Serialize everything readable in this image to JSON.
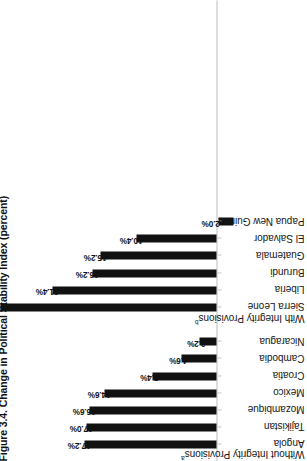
{
  "figure": {
    "title": "Figure 3.4. Change in Political Stability Index (percent)",
    "groups": [
      {
        "id": "without",
        "label": "Without Integrity Provisions",
        "note": "a"
      },
      {
        "id": "with",
        "label": "With Integrity Provisions",
        "note": "b"
      }
    ]
  },
  "chart_data": {
    "type": "bar",
    "title": "Figure 3.4. Change in Political Stability Index (percent)",
    "xlabel": "",
    "ylabel": "percent",
    "orientation": "vertical-bars-rotated-90",
    "ylim": [
      -4,
      30
    ],
    "grid": false,
    "legend": null,
    "categories": [
      "Angola",
      "Tajikistan",
      "Mozambique",
      "Mexico",
      "Croatia",
      "Cambodia",
      "Nicaragua",
      "Sierra Leone",
      "Liberia",
      "Burundi",
      "Guatemala",
      "El Salvador",
      "Papua New Guinea"
    ],
    "values": [
      17.2,
      17.0,
      16.6,
      14.6,
      8.4,
      4.6,
      2.2,
      29.0,
      21.4,
      16.2,
      15.2,
      10.4,
      -2.0
    ],
    "value_labels": [
      "17.2%",
      "17.0%",
      "16.6%",
      "14.6%",
      "8.4%",
      "4.6%",
      "2.2%",
      "",
      "21.4%",
      "16.2%",
      "15.2%",
      "10.4%",
      "-2.0%"
    ],
    "group_of": [
      "Without Integrity Provisions",
      "Without Integrity Provisions",
      "Without Integrity Provisions",
      "Without Integrity Provisions",
      "Without Integrity Provisions",
      "Without Integrity Provisions",
      "Without Integrity Provisions",
      "With Integrity Provisions",
      "With Integrity Provisions",
      "With Integrity Provisions",
      "With Integrity Provisions",
      "With Integrity Provisions",
      "With Integrity Provisions"
    ],
    "notes": {
      "without_integrity_provisions": "a",
      "with_integrity_provisions": "b"
    },
    "bar_color": "#111111",
    "baseline_color": "#bdbdbd"
  }
}
